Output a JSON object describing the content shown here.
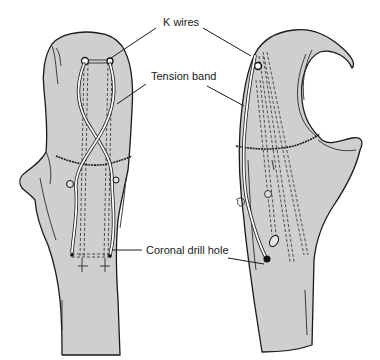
{
  "figure": {
    "labels": {
      "k_wires": "K wires",
      "tension_band": "Tension band",
      "coronal_drill_hole": "Coronal drill hole"
    },
    "colors": {
      "bone_fill": "#cfcfcf",
      "outline": "#1a1a1a",
      "background": "#ffffff"
    },
    "views": [
      {
        "name": "anterior-view",
        "position": "left"
      },
      {
        "name": "lateral-view",
        "position": "right"
      }
    ]
  }
}
